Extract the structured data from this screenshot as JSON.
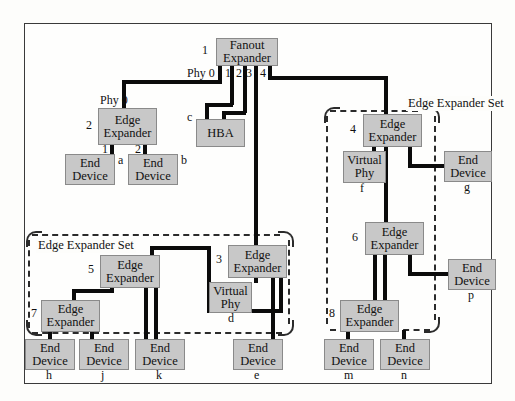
{
  "figure": {
    "outer_border": true
  },
  "nodes": {
    "fanout_expander": {
      "line1": "Fanout",
      "line2": "Expander",
      "index": "1"
    },
    "edge_expander_2": {
      "line1": "Edge",
      "line2": "Expander",
      "index": "2"
    },
    "edge_expander_3": {
      "line1": "Edge",
      "line2": "Expander",
      "index": "3"
    },
    "edge_expander_4": {
      "line1": "Edge",
      "line2": "Expander",
      "index": "4"
    },
    "edge_expander_5": {
      "line1": "Edge",
      "line2": "Expander",
      "index": "5"
    },
    "edge_expander_6": {
      "line1": "Edge",
      "line2": "Expander",
      "index": "6"
    },
    "edge_expander_7": {
      "line1": "Edge",
      "line2": "Expander",
      "index": "7"
    },
    "edge_expander_8": {
      "line1": "Edge",
      "line2": "Expander",
      "index": "8"
    },
    "hba": {
      "line1": "HBA",
      "line2": "",
      "label": "c"
    },
    "virtual_phy_d": {
      "line1": "Virtual",
      "line2": "Phy",
      "label": "d"
    },
    "virtual_phy_f": {
      "line1": "Virtual",
      "line2": "Phy",
      "label": "f"
    },
    "end_device_a": {
      "line1": "End",
      "line2": "Device",
      "label": "a"
    },
    "end_device_b": {
      "line1": "End",
      "line2": "Device",
      "label": "b"
    },
    "end_device_e": {
      "line1": "End",
      "line2": "Device",
      "label": "e"
    },
    "end_device_g": {
      "line1": "End",
      "line2": "Device",
      "label": "g"
    },
    "end_device_h": {
      "line1": "End",
      "line2": "Device",
      "label": "h"
    },
    "end_device_j": {
      "line1": "End",
      "line2": "Device",
      "label": "j"
    },
    "end_device_k": {
      "line1": "End",
      "line2": "Device",
      "label": "k"
    },
    "end_device_m": {
      "line1": "End",
      "line2": "Device",
      "label": "m"
    },
    "end_device_n": {
      "line1": "End",
      "line2": "Device",
      "label": "n"
    },
    "end_device_p": {
      "line1": "End",
      "line2": "Device",
      "label": "p"
    }
  },
  "phy_labels": {
    "fanout_phy0": "Phy 0",
    "fanout_phy1": "1",
    "fanout_phy2": "2",
    "fanout_phy3": "3",
    "fanout_phy4": "4",
    "ee2_phy0": "Phy 0",
    "ee2_phy1": "1",
    "ee2_phy2": "2"
  },
  "groups": {
    "set_left": "Edge Expander Set",
    "set_right": "Edge Expander Set"
  },
  "colors": {
    "node_fill": "#c8c8c8",
    "node_border": "#8a8a8a",
    "wire": "#0b0b0b",
    "dashed": "#2b2b2b",
    "outer_border": "#3a3a3a",
    "page_bg": "#fdfdfb"
  }
}
